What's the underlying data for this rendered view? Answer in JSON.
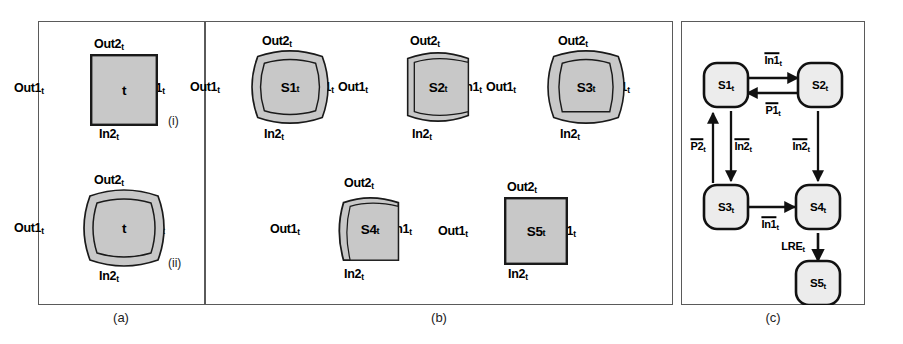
{
  "figure": {
    "panels": [
      {
        "id": "a",
        "caption": "(a)"
      },
      {
        "id": "b",
        "caption": "(b)"
      },
      {
        "id": "c",
        "caption": "(c)"
      }
    ]
  },
  "ports": {
    "top": "Out2",
    "left": "Out1",
    "right": "In1",
    "bottom": "In2",
    "subscript": "t"
  },
  "panel_a": {
    "caption": "(a)",
    "items": [
      {
        "index": "(i)",
        "label": "t",
        "shape": "square",
        "ports": {
          "top": "Out2",
          "left": "Out1",
          "right": "In1",
          "bottom": "In2"
        }
      },
      {
        "index": "(ii)",
        "label": "t",
        "shape": "barrel-all",
        "ports": {
          "top": "Out2",
          "left": "Out1",
          "right": "In1",
          "bottom": "In2"
        }
      }
    ]
  },
  "panel_b": {
    "caption": "(b)",
    "items": [
      {
        "label": "S1",
        "sub": "t",
        "shape": "barrel-all",
        "ports": {
          "top": "Out2",
          "left": "Out1",
          "right": "In1",
          "bottom": "In2"
        }
      },
      {
        "label": "S2",
        "sub": "t",
        "shape": "cylinder-v",
        "ports": {
          "top": "Out2",
          "left": "Out1",
          "right": "In1",
          "bottom": "In2"
        }
      },
      {
        "label": "S3",
        "sub": "t",
        "shape": "barrel-all",
        "ports": {
          "top": "Out2",
          "left": "Out1",
          "right": "In1",
          "bottom": "In2"
        }
      },
      {
        "label": "S4",
        "sub": "t",
        "shape": "bulge-left-top",
        "ports": {
          "top": "Out2",
          "left": "Out1",
          "right": "In1",
          "bottom": "In2"
        }
      },
      {
        "label": "S5",
        "sub": "t",
        "shape": "square",
        "ports": {
          "top": "Out2",
          "left": "Out1",
          "right": "In1",
          "bottom": "In2"
        }
      }
    ]
  },
  "panel_c": {
    "caption": "(c)",
    "nodes": [
      {
        "id": "S1",
        "label": "S1",
        "sub": "t"
      },
      {
        "id": "S2",
        "label": "S2",
        "sub": "t"
      },
      {
        "id": "S3",
        "label": "S3",
        "sub": "t"
      },
      {
        "id": "S4",
        "label": "S4",
        "sub": "t"
      },
      {
        "id": "S5",
        "label": "S5",
        "sub": "t"
      }
    ],
    "transitions": [
      {
        "from": "S1",
        "to": "S2",
        "label": "In1",
        "sub": "t",
        "overline": true
      },
      {
        "from": "S2",
        "to": "S1",
        "label": "P1",
        "sub": "t",
        "overline": true
      },
      {
        "from": "S1",
        "to": "S3",
        "label": "In2",
        "sub": "t",
        "overline": true
      },
      {
        "from": "S3",
        "to": "S1",
        "label": "P2",
        "sub": "t",
        "overline": true
      },
      {
        "from": "S2",
        "to": "S4",
        "label": "In2",
        "sub": "t",
        "overline": true
      },
      {
        "from": "S3",
        "to": "S4",
        "label": "In1",
        "sub": "t",
        "overline": true
      },
      {
        "from": "S4",
        "to": "S5",
        "label": "LRE",
        "sub": "t",
        "overline": false
      }
    ]
  },
  "colors": {
    "shape_fill": "#c8c8c8",
    "shape_stroke": "#1a1a1a",
    "panel_border": "#5a5a5a",
    "text": "#000000",
    "background": "#ffffff"
  }
}
